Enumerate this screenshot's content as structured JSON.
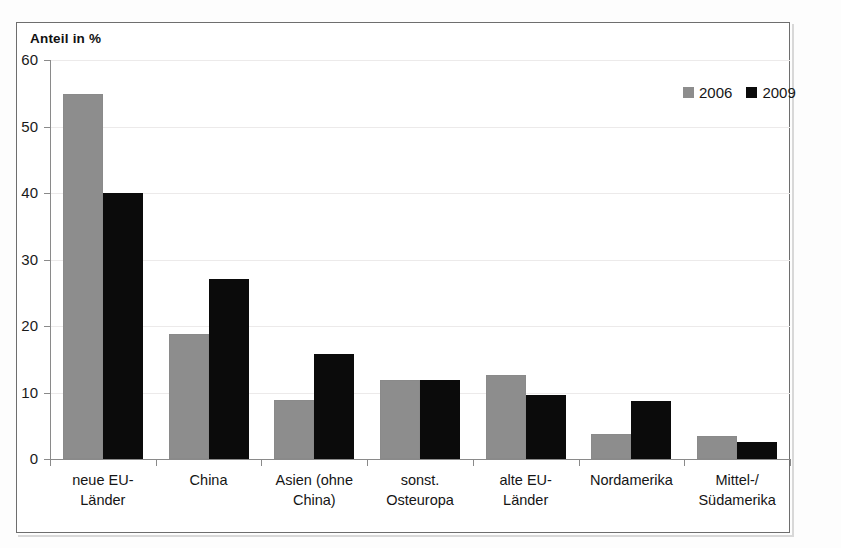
{
  "chart_data": {
    "type": "bar",
    "title": "",
    "subtitle": "",
    "xlabel": "",
    "ylabel": "Anteil in %",
    "ylim": [
      0,
      60
    ],
    "ytick_step": 10,
    "yticks": [
      0,
      10,
      20,
      30,
      40,
      50,
      60
    ],
    "ytick_labels": [
      "0",
      "10",
      "20",
      "30",
      "40",
      "50",
      "60"
    ],
    "grid": true,
    "grid_axis": "y",
    "legend_position": "top-right",
    "categories": [
      "neue EU-\nLänder",
      "China",
      "Asien (ohne\nChina)",
      "sonst.\nOsteuropa",
      "alte EU-\nLänder",
      "Nordamerika",
      "Mittel-/\nSüdamerika"
    ],
    "series": [
      {
        "name": "2006",
        "color": "#8d8d8d",
        "values": [
          54.9,
          18.8,
          8.9,
          11.9,
          12.6,
          3.7,
          3.5
        ]
      },
      {
        "name": "2009",
        "color": "#0b0b0b",
        "values": [
          40.0,
          27.0,
          15.8,
          11.9,
          9.7,
          8.7,
          2.6
        ]
      }
    ]
  },
  "legend": {
    "items": [
      {
        "label": "2006",
        "swatch": "gray-square-icon"
      },
      {
        "label": "2009",
        "swatch": "black-square-icon"
      }
    ]
  },
  "axis": {
    "y_title": "Anteil in %"
  }
}
